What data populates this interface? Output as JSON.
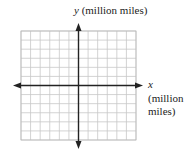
{
  "labels": {
    "y_var": "y",
    "y_unit": "(million miles)",
    "x_var": "x",
    "x_unit_line1": "(million",
    "x_unit_line2": "miles)"
  },
  "colors": {
    "grid": "#c8c8c8",
    "axis": "#222222"
  },
  "chart_data": {
    "type": "scatter",
    "title": "",
    "xlabel": "x (million miles)",
    "ylabel": "y (million miles)",
    "grid": true,
    "grid_columns": 12,
    "grid_rows": 12,
    "x": [],
    "y": []
  }
}
